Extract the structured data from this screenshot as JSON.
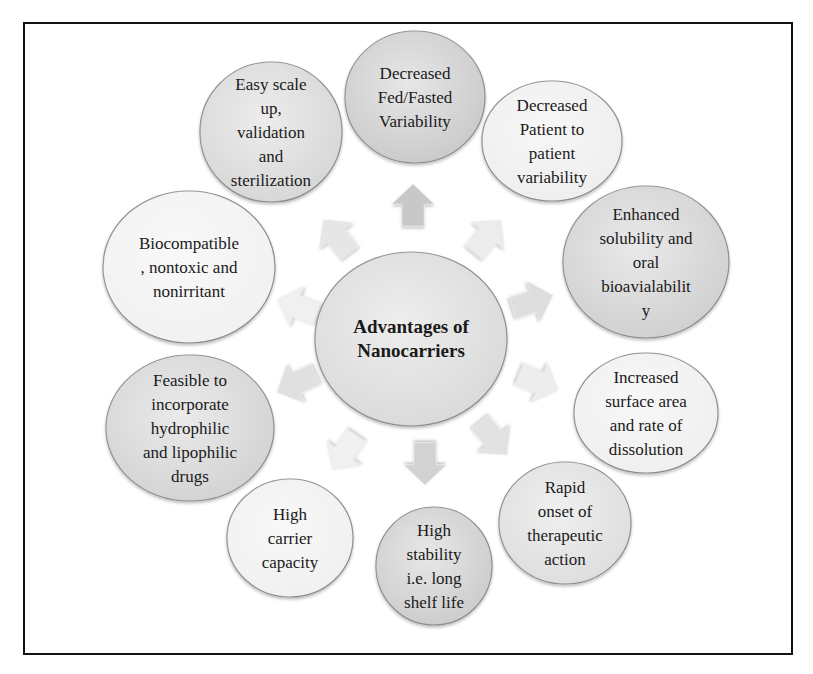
{
  "diagram": {
    "type": "radial-hub",
    "hub": {
      "lines": [
        "Advantages of",
        "Nanocarriers"
      ],
      "cx": 411,
      "cy": 339,
      "rx": 96,
      "ry": 87,
      "fill": "#d9d9d9"
    },
    "nodes": [
      {
        "id": "fed-fasted",
        "lines": [
          "Decreased",
          "Fed/Fasted",
          "Variability"
        ],
        "cx": 415,
        "cy": 97,
        "rx": 70,
        "ry": 66,
        "fill": "#c9c9c9"
      },
      {
        "id": "patient-variability",
        "lines": [
          "Decreased",
          "Patient to",
          "patient",
          "variability"
        ],
        "cx": 552,
        "cy": 141,
        "rx": 70,
        "ry": 60,
        "fill": "#eeeeee"
      },
      {
        "id": "solubility",
        "lines": [
          "Enhanced",
          "solubility and",
          "oral",
          "bioavialabilit",
          "y"
        ],
        "cx": 646,
        "cy": 262,
        "rx": 83,
        "ry": 76,
        "fill": "#cfcfcf"
      },
      {
        "id": "surface-area",
        "lines": [
          "Increased",
          "surface area",
          "and rate of",
          "dissolution"
        ],
        "cx": 646,
        "cy": 413,
        "rx": 72,
        "ry": 60,
        "fill": "#efefef"
      },
      {
        "id": "rapid-onset",
        "lines": [
          "Rapid",
          "onset of",
          "therapeutic",
          "action"
        ],
        "cx": 565,
        "cy": 523,
        "rx": 66,
        "ry": 61,
        "fill": "#dddddd"
      },
      {
        "id": "high-stability",
        "lines": [
          "High",
          "stability",
          "i.e. long",
          "shelf life"
        ],
        "cx": 434,
        "cy": 566,
        "rx": 58,
        "ry": 59,
        "fill": "#cbcbcb"
      },
      {
        "id": "carrier-capacity",
        "lines": [
          "High",
          "carrier",
          "capacity"
        ],
        "cx": 290,
        "cy": 538,
        "rx": 63,
        "ry": 59,
        "fill": "#f0f0f0"
      },
      {
        "id": "hydrophilic-lipophilic",
        "lines": [
          "Feasible to",
          "incorporate",
          "hydrophilic",
          "and lipophilic",
          "drugs"
        ],
        "cx": 190,
        "cy": 428,
        "rx": 84,
        "ry": 73,
        "fill": "#d2d2d2"
      },
      {
        "id": "biocompatible",
        "lines": [
          "Biocompatible",
          ", nontoxic and",
          "nonirritant"
        ],
        "cx": 189,
        "cy": 267,
        "rx": 86,
        "ry": 76,
        "fill": "#f1f1f1"
      },
      {
        "id": "scale-up",
        "lines": [
          "Easy scale",
          "up,",
          "validation",
          "and",
          "sterilization"
        ],
        "cx": 271,
        "cy": 132,
        "rx": 71,
        "ry": 70,
        "fill": "#d6d6d6"
      }
    ],
    "arrows": [
      {
        "to": "fed-fasted",
        "x": 413,
        "y": 206,
        "angle": 0,
        "fill": "#c8c8c8"
      },
      {
        "to": "patient-variability",
        "x": 487,
        "y": 237,
        "angle": 40,
        "fill": "#ececec"
      },
      {
        "to": "solubility",
        "x": 532,
        "y": 302,
        "angle": 72,
        "fill": "#dedede"
      },
      {
        "to": "surface-area",
        "x": 538,
        "y": 382,
        "angle": 112,
        "fill": "#ededed"
      },
      {
        "to": "rapid-onset",
        "x": 493,
        "y": 438,
        "angle": 140,
        "fill": "#e2e2e2"
      },
      {
        "to": "high-stability",
        "x": 425,
        "y": 463,
        "angle": 180,
        "fill": "#d2d2d2"
      },
      {
        "to": "carrier-capacity",
        "x": 345,
        "y": 452,
        "angle": 215,
        "fill": "#f0f0f0"
      },
      {
        "to": "hydrophilic-lipophilic",
        "x": 297,
        "y": 383,
        "angle": 245,
        "fill": "#e0e0e0"
      },
      {
        "to": "biocompatible",
        "x": 298,
        "y": 307,
        "angle": 290,
        "fill": "#f0f0f0"
      },
      {
        "to": "scale-up",
        "x": 337,
        "y": 237,
        "angle": 322,
        "fill": "#e6e6e6"
      }
    ],
    "colors": {
      "frame": "#111111",
      "circle_stroke": "#8a8a8a",
      "text": "#1a1a1a",
      "background": "#ffffff"
    }
  }
}
